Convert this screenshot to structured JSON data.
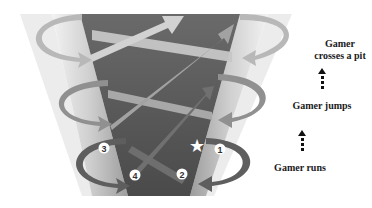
{
  "diagram": {
    "labels": {
      "top": "Gamer\ncrosses a pit",
      "top_line1": "Gamer",
      "top_line2": "crosses a pit",
      "middle": "Gamer jumps",
      "bottom": "Gamer runs"
    },
    "markers": [
      "1",
      "2",
      "3",
      "4"
    ],
    "star": "★",
    "colors": {
      "background": "#ffffff",
      "pillar_light": "#d8d8d8",
      "pillar_mid": "#a8a8a8",
      "center_dark": "#555555",
      "arrow_top": "#bcbcbc",
      "arrow_mid": "#9a9a9a",
      "arrow_low": "#707070",
      "text": "#1a1a1a"
    }
  }
}
